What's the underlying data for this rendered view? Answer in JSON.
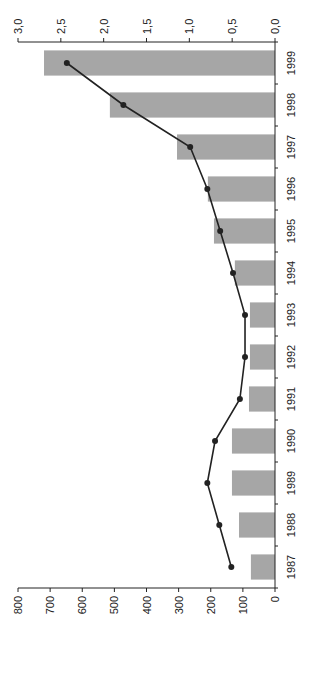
{
  "chart_data": {
    "type": "bar",
    "orientation": "rotated 90 degrees (years run top-to-bottom 1999 to 1987)",
    "title": "",
    "xlabel": "",
    "categories": [
      "1987",
      "1988",
      "1989",
      "1990",
      "1991",
      "1992",
      "1993",
      "1994",
      "1995",
      "1996",
      "1997",
      "1998",
      "1999"
    ],
    "series": [
      {
        "name": "Bars",
        "type": "bar",
        "axis": "primary",
        "color": "#a6a6a6",
        "values": [
          75,
          112,
          134,
          134,
          81,
          78,
          78,
          125,
          190,
          209,
          305,
          514,
          719
        ]
      },
      {
        "name": "Line",
        "type": "line",
        "axis": "secondary",
        "color": "#222222",
        "marker": "circle",
        "values": [
          0.51,
          0.65,
          0.79,
          0.7,
          0.41,
          0.35,
          0.35,
          0.49,
          0.64,
          0.79,
          0.99,
          1.77,
          2.43
        ]
      }
    ],
    "primary_axis": {
      "ticks": [
        "0",
        "100",
        "200",
        "300",
        "400",
        "500",
        "600",
        "700",
        "800"
      ],
      "ylim": [
        0,
        800
      ]
    },
    "secondary_axis": {
      "ticks": [
        "0,0",
        "0,5",
        "1,0",
        "1,5",
        "2,0",
        "2,5",
        "3,0"
      ],
      "ylim": [
        0,
        3.0
      ]
    },
    "grid": false,
    "legend": null
  }
}
